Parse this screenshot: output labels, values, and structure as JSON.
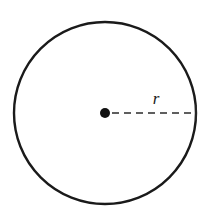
{
  "figure": {
    "kind": "geometry-diagram",
    "background_color": "#ffffff"
  },
  "shapes": {
    "circle": {
      "name": "circle-outline",
      "center_x": 105,
      "center_y": 113,
      "radius": 91,
      "stroke_color": "#1a1a1a",
      "stroke_width": 2.4,
      "fill": "none"
    },
    "center_point": {
      "name": "center-dot",
      "x": 105,
      "y": 113,
      "dot_radius": 5,
      "color": "#111111"
    },
    "radius_line": {
      "name": "radius-dashed-line",
      "x1": 112,
      "y1": 113,
      "x2": 196,
      "y2": 113,
      "stroke_color": "#2b2b2b",
      "stroke_width": 1.6,
      "dash_pattern": "7 5"
    },
    "end_tick": {
      "name": "radius-endpoint-tick",
      "x": 196,
      "y1": 105,
      "y2": 121,
      "stroke_color": "#2b2b2b",
      "stroke_width": 1.4
    }
  },
  "labels": {
    "radius": {
      "text": "r",
      "x": 156,
      "y": 104,
      "font_size": 17,
      "italic": true,
      "color": "#1a1a1a"
    }
  }
}
